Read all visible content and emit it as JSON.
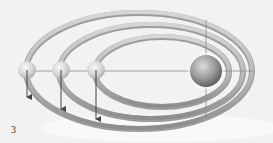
{
  "figure": {
    "label": "3",
    "background": "#f2f2f2",
    "colors": {
      "ring_light": "#d0d0d0",
      "ring_dark": "#8a8a8a",
      "ring_edge": "#9a9a9a",
      "axis_line": "#888888",
      "arrow": "#444444",
      "sun_light": "#d8d8d8",
      "sun_dark": "#5a5a5a",
      "planet_light": "#f4f4f4",
      "planet_dark": "#b0b0b0"
    },
    "sun": {
      "cx": 206,
      "cy": 71,
      "r": 16
    },
    "orbits": [
      {
        "name": "outer",
        "cx": 139,
        "cy": 70,
        "rx": 113,
        "ry": 58
      },
      {
        "name": "middle",
        "cx": 151,
        "cy": 71,
        "rx": 92,
        "ry": 47
      },
      {
        "name": "inner",
        "cx": 162,
        "cy": 71,
        "rx": 67,
        "ry": 35
      }
    ],
    "planets": [
      {
        "cx": 27,
        "cy": 70,
        "r": 9,
        "arrow_to": 97
      },
      {
        "cx": 61,
        "cy": 70,
        "r": 9,
        "arrow_to": 109
      },
      {
        "cx": 96,
        "cy": 70,
        "r": 9,
        "arrow_to": 119
      }
    ],
    "axes": {
      "horizontal": {
        "x1": 27,
        "x2": 253,
        "y": 71
      },
      "vertical": {
        "x": 206,
        "y1": 20,
        "y2": 118
      }
    }
  }
}
